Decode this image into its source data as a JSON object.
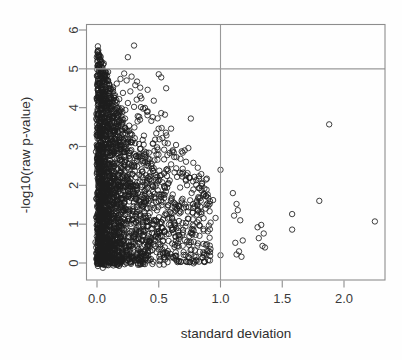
{
  "chart_data": {
    "type": "scatter",
    "title": "",
    "xlabel": "standard deviation",
    "ylabel": "-log10(raw p-value)",
    "xlim": [
      -0.06,
      2.38
    ],
    "ylim": [
      -0.28,
      6.35
    ],
    "xticks": [
      0.0,
      0.5,
      1.0,
      1.5,
      2.0
    ],
    "xtick_labels": [
      "0.0",
      "0.5",
      "1.0",
      "1.5",
      "2.0"
    ],
    "yticks": [
      0,
      1,
      2,
      3,
      4,
      5,
      6
    ],
    "ytick_labels": [
      "0",
      "1",
      "2",
      "3",
      "4",
      "5",
      "6"
    ],
    "grid": false,
    "legend": null,
    "marker": "open-circle",
    "marker_color": "#1d1d1d",
    "reference_lines": [
      {
        "orientation": "horizontal",
        "value": 5.0,
        "color": "#999999"
      },
      {
        "orientation": "vertical",
        "value": 1.0,
        "color": "#999999"
      }
    ],
    "n_points_approx": 2400,
    "outlier_points": [
      [
        0.3,
        5.6
      ],
      [
        0.25,
        5.3
      ],
      [
        0.09,
        4.92
      ],
      [
        0.22,
        4.88
      ],
      [
        0.5,
        4.86
      ],
      [
        0.28,
        4.8
      ],
      [
        0.52,
        4.78
      ],
      [
        0.19,
        4.74
      ],
      [
        0.24,
        4.7
      ],
      [
        0.16,
        4.62
      ],
      [
        0.31,
        4.58
      ],
      [
        0.13,
        4.52
      ],
      [
        0.56,
        4.5
      ],
      [
        0.41,
        4.46
      ],
      [
        0.27,
        4.42
      ],
      [
        0.21,
        4.38
      ],
      [
        0.35,
        4.3
      ],
      [
        0.18,
        4.22
      ],
      [
        0.46,
        4.18
      ],
      [
        0.25,
        4.12
      ],
      [
        0.15,
        4.06
      ],
      [
        0.3,
        4.02
      ],
      [
        0.2,
        3.98
      ],
      [
        0.23,
        3.94
      ],
      [
        0.12,
        3.9
      ],
      [
        0.52,
        3.86
      ],
      [
        0.55,
        3.82
      ],
      [
        0.33,
        3.78
      ],
      [
        0.76,
        3.72
      ],
      [
        0.44,
        3.66
      ],
      [
        1.88,
        3.57
      ],
      [
        0.6,
        3.46
      ],
      [
        0.26,
        3.4
      ],
      [
        0.48,
        3.34
      ],
      [
        0.38,
        3.28
      ],
      [
        0.53,
        3.22
      ],
      [
        0.29,
        3.16
      ],
      [
        0.18,
        3.1
      ],
      [
        0.64,
        3.04
      ],
      [
        0.74,
        2.96
      ],
      [
        0.71,
        2.9
      ],
      [
        0.42,
        2.84
      ],
      [
        0.57,
        2.78
      ],
      [
        0.34,
        2.72
      ],
      [
        0.49,
        2.66
      ],
      [
        0.78,
        2.58
      ],
      [
        0.6,
        2.54
      ],
      [
        0.44,
        2.5
      ],
      [
        1.0,
        2.4
      ],
      [
        0.67,
        2.32
      ],
      [
        0.52,
        2.26
      ],
      [
        0.37,
        2.2
      ],
      [
        0.72,
        2.12
      ],
      [
        0.58,
        2.06
      ],
      [
        0.45,
        2.0
      ],
      [
        1.1,
        1.8
      ],
      [
        0.86,
        1.74
      ],
      [
        0.9,
        1.68
      ],
      [
        0.94,
        1.62
      ],
      [
        1.8,
        1.6
      ],
      [
        0.62,
        1.56
      ],
      [
        1.13,
        1.52
      ],
      [
        0.79,
        1.46
      ],
      [
        0.88,
        1.4
      ],
      [
        1.14,
        1.36
      ],
      [
        1.58,
        1.26
      ],
      [
        1.11,
        1.22
      ],
      [
        0.96,
        1.16
      ],
      [
        1.16,
        1.1
      ],
      [
        0.92,
        1.04
      ],
      [
        2.25,
        1.07
      ],
      [
        1.33,
        0.98
      ],
      [
        1.3,
        0.92
      ],
      [
        1.58,
        0.86
      ],
      [
        1.35,
        0.76
      ],
      [
        0.83,
        0.7
      ],
      [
        1.31,
        0.64
      ],
      [
        1.18,
        0.58
      ],
      [
        1.12,
        0.52
      ],
      [
        1.34,
        0.44
      ],
      [
        1.36,
        0.4
      ],
      [
        1.15,
        0.3
      ],
      [
        1.13,
        0.22
      ],
      [
        1.0,
        0.2
      ],
      [
        1.17,
        0.16
      ]
    ]
  },
  "axes": {
    "x_title": "standard deviation",
    "y_title": "-log10(raw p-value)",
    "x_tick_labels": [
      "0.0",
      "0.5",
      "1.0",
      "1.5",
      "2.0"
    ],
    "y_tick_labels": [
      "0",
      "1",
      "2",
      "3",
      "4",
      "5",
      "6"
    ]
  }
}
